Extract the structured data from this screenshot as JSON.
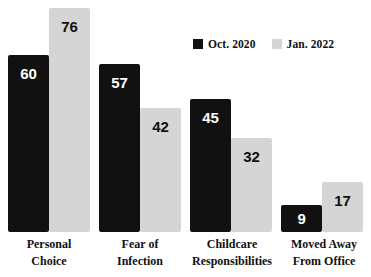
{
  "chart_data": {
    "type": "bar",
    "title": "",
    "subtitle": "",
    "xlabel": "",
    "ylabel": "",
    "ylim": [
      0,
      80
    ],
    "grid": false,
    "legend_position": "top-right",
    "categories": [
      "Personal Choice",
      "Fear of Infection",
      "Childcare Responsibilities",
      "Moved Away From Office"
    ],
    "category_lines": [
      [
        "Personal",
        "Choice"
      ],
      [
        "Fear of",
        "Infection"
      ],
      [
        "Childcare",
        "Responsibilities"
      ],
      [
        "Moved Away",
        "From Office"
      ]
    ],
    "series": [
      {
        "name": "Oct. 2020",
        "color": "#111111",
        "values": [
          60,
          57,
          45,
          9
        ]
      },
      {
        "name": "Jan. 2022",
        "color": "#d5d5d5",
        "values": [
          76,
          42,
          32,
          17
        ]
      }
    ]
  },
  "legend": {
    "entries": [
      {
        "label": "Oct. 2020",
        "swatch": "dark-square-swatch"
      },
      {
        "label": "Jan. 2022",
        "swatch": "light-square-swatch"
      }
    ]
  },
  "colors": {
    "series_dark": "#111111",
    "series_light": "#d5d5d5",
    "background": "#ffffff",
    "text": "#111111"
  },
  "bars": [
    {
      "group": 0,
      "series": 0,
      "value": "60"
    },
    {
      "group": 0,
      "series": 1,
      "value": "76"
    },
    {
      "group": 1,
      "series": 0,
      "value": "57"
    },
    {
      "group": 1,
      "series": 1,
      "value": "42"
    },
    {
      "group": 2,
      "series": 0,
      "value": "45"
    },
    {
      "group": 2,
      "series": 1,
      "value": "32"
    },
    {
      "group": 3,
      "series": 0,
      "value": "9"
    },
    {
      "group": 3,
      "series": 1,
      "value": "17"
    }
  ]
}
